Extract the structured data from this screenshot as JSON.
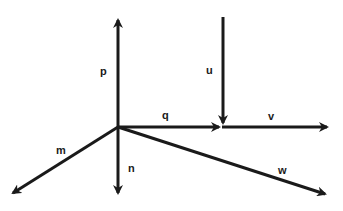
{
  "diagram": {
    "type": "vector diagram",
    "colors": {
      "stroke": "#1a1a1a",
      "background": "#ffffff"
    },
    "vectors": [
      {
        "id": "p",
        "label": "p",
        "from": [
          118,
          127
        ],
        "to": [
          118,
          17
        ]
      },
      {
        "id": "n",
        "label": "n",
        "from": [
          118,
          127
        ],
        "to": [
          118,
          196
        ]
      },
      {
        "id": "m",
        "label": "m",
        "from": [
          118,
          127
        ],
        "to": [
          10,
          195
        ]
      },
      {
        "id": "q",
        "label": "q",
        "from": [
          118,
          127
        ],
        "to": [
          222,
          127
        ]
      },
      {
        "id": "u",
        "label": "u",
        "from": [
          223,
          17
        ],
        "to": [
          223,
          126
        ]
      },
      {
        "id": "v",
        "label": "v",
        "from": [
          223,
          127
        ],
        "to": [
          330,
          127
        ]
      },
      {
        "id": "w",
        "label": "w",
        "from": [
          118,
          127
        ],
        "to": [
          328,
          195
        ]
      }
    ],
    "labels": {
      "p": "p",
      "n": "n",
      "m": "m",
      "q": "q",
      "u": "u",
      "v": "v",
      "w": "w"
    }
  }
}
